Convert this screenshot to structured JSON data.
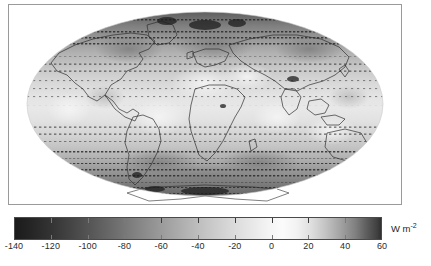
{
  "figure": {
    "kind": "global-map-with-colorbar",
    "background_color": "#ffffff",
    "frame_color": "#9a9a9a"
  },
  "map": {
    "projection": "mollweide",
    "title": "",
    "land_outline_color": "#3a3a3a",
    "vector_overlay": "quiver-arrows",
    "vector_color": "#2a2a2a",
    "graticule_shown": false,
    "coastlines_shown": true
  },
  "colorbar": {
    "orientation": "horizontal",
    "unit_label": "W m",
    "unit_exponent": "-2",
    "vmin": -140,
    "vmax": 60,
    "colormap": "grayscale-diverging",
    "tick_values": [
      -140,
      -120,
      -100,
      -80,
      -60,
      -40,
      -20,
      0,
      20,
      40,
      60
    ],
    "tick_labels": [
      "-140",
      "-120",
      "-100",
      "-80",
      "-60",
      "-40",
      "-20",
      "0",
      "20",
      "40",
      "60"
    ]
  },
  "chart_data": {
    "type": "heatmap",
    "title": "",
    "xlabel": "",
    "ylabel": "",
    "projection": "mollweide",
    "variable": "surface flux",
    "units": "W m-2",
    "colorbar": {
      "min": -140,
      "max": 60,
      "ticks": [
        -140,
        -120,
        -100,
        -80,
        -60,
        -40,
        -20,
        0,
        20,
        40,
        60
      ],
      "colormap": "grayscale"
    },
    "field_summary": {
      "tropics_value": -10,
      "subtropics_value": -25,
      "midlatitude_value": -55,
      "high_latitude_value": -95,
      "polar_value": -130,
      "land_desert_value": 5,
      "note": "values brighten toward zero near the equator and darken poleward"
    },
    "latitude_bands": [
      {
        "lat": 80,
        "value": -130
      },
      {
        "lat": 70,
        "value": -115
      },
      {
        "lat": 60,
        "value": -95
      },
      {
        "lat": 50,
        "value": -75
      },
      {
        "lat": 40,
        "value": -55
      },
      {
        "lat": 30,
        "value": -35
      },
      {
        "lat": 20,
        "value": -20
      },
      {
        "lat": 10,
        "value": -10
      },
      {
        "lat": 0,
        "value": -8
      },
      {
        "lat": -10,
        "value": -12
      },
      {
        "lat": -20,
        "value": -22
      },
      {
        "lat": -30,
        "value": -38
      },
      {
        "lat": -40,
        "value": -60
      },
      {
        "lat": -50,
        "value": -82
      },
      {
        "lat": -60,
        "value": -105
      },
      {
        "lat": -70,
        "value": -125
      },
      {
        "lat": -80,
        "value": -135
      }
    ],
    "grid": false,
    "legend_position": "below"
  }
}
